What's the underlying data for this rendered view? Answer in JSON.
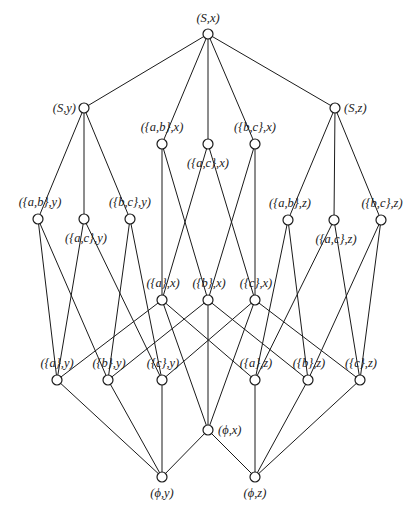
{
  "diagram": {
    "type": "hasse-lattice",
    "nodes": [
      {
        "id": "S_x",
        "label": "(S,x)",
        "x": 208,
        "y": 34,
        "lx": 208,
        "ly": 22,
        "anchor": "middle"
      },
      {
        "id": "S_y",
        "label": "(S,y)",
        "x": 84,
        "y": 108,
        "lx": 76,
        "ly": 112,
        "anchor": "end"
      },
      {
        "id": "S_z",
        "label": "(S,z)",
        "x": 335,
        "y": 108,
        "lx": 344,
        "ly": 112,
        "anchor": "start"
      },
      {
        "id": "ab_x",
        "label": "({a,b},x)",
        "x": 162,
        "y": 144,
        "lx": 162,
        "ly": 131,
        "anchor": "middle"
      },
      {
        "id": "ac_x",
        "label": "({a,c},x)",
        "x": 208,
        "y": 144,
        "lx": 208,
        "ly": 167,
        "anchor": "middle"
      },
      {
        "id": "bc_x",
        "label": "({b,c},x)",
        "x": 255,
        "y": 144,
        "lx": 255,
        "ly": 131,
        "anchor": "middle"
      },
      {
        "id": "ab_y",
        "label": "({a,b},y)",
        "x": 38,
        "y": 219,
        "lx": 40,
        "ly": 206,
        "anchor": "middle"
      },
      {
        "id": "ac_y",
        "label": "({a,c},y)",
        "x": 84,
        "y": 219,
        "lx": 86,
        "ly": 242,
        "anchor": "middle"
      },
      {
        "id": "bc_y",
        "label": "({b,c},y)",
        "x": 130,
        "y": 219,
        "lx": 130,
        "ly": 206,
        "anchor": "middle"
      },
      {
        "id": "ab_z",
        "label": "({a,b},z)",
        "x": 288,
        "y": 220,
        "lx": 290,
        "ly": 207,
        "anchor": "middle"
      },
      {
        "id": "ac_z",
        "label": "({a,c},z)",
        "x": 334,
        "y": 220,
        "lx": 336,
        "ly": 243,
        "anchor": "middle"
      },
      {
        "id": "bc_z",
        "label": "({b,c},z)",
        "x": 381,
        "y": 220,
        "lx": 382,
        "ly": 207,
        "anchor": "middle"
      },
      {
        "id": "a_x",
        "label": "({a},x)",
        "x": 162,
        "y": 300,
        "lx": 163,
        "ly": 287,
        "anchor": "middle"
      },
      {
        "id": "b_x",
        "label": "({b},x)",
        "x": 208,
        "y": 300,
        "lx": 209,
        "ly": 287,
        "anchor": "middle"
      },
      {
        "id": "c_x",
        "label": "({c},x)",
        "x": 255,
        "y": 300,
        "lx": 256,
        "ly": 287,
        "anchor": "middle"
      },
      {
        "id": "a_y",
        "label": "({a},y)",
        "x": 57,
        "y": 380,
        "lx": 57,
        "ly": 367,
        "anchor": "middle"
      },
      {
        "id": "b_y",
        "label": "({b},y)",
        "x": 108,
        "y": 380,
        "lx": 109,
        "ly": 367,
        "anchor": "middle"
      },
      {
        "id": "c_y",
        "label": "({c},y)",
        "x": 162,
        "y": 380,
        "lx": 163,
        "ly": 367,
        "anchor": "middle"
      },
      {
        "id": "a_z",
        "label": "({a},z)",
        "x": 255,
        "y": 380,
        "lx": 256,
        "ly": 367,
        "anchor": "middle"
      },
      {
        "id": "b_z",
        "label": "({b},z)",
        "x": 308,
        "y": 380,
        "lx": 309,
        "ly": 367,
        "anchor": "middle"
      },
      {
        "id": "c_z",
        "label": "({c},z)",
        "x": 360,
        "y": 380,
        "lx": 361,
        "ly": 367,
        "anchor": "middle"
      },
      {
        "id": "phi_x",
        "label": "(ϕ,x)",
        "x": 208,
        "y": 430,
        "lx": 218,
        "ly": 434,
        "anchor": "start"
      },
      {
        "id": "phi_y",
        "label": "(ϕ,y)",
        "x": 162,
        "y": 477,
        "lx": 162,
        "ly": 497,
        "anchor": "middle"
      },
      {
        "id": "phi_z",
        "label": "(ϕ,z)",
        "x": 255,
        "y": 477,
        "lx": 255,
        "ly": 497,
        "anchor": "middle"
      }
    ],
    "edges": [
      [
        "S_x",
        "S_y"
      ],
      [
        "S_x",
        "ab_x"
      ],
      [
        "S_x",
        "ac_x"
      ],
      [
        "S_x",
        "bc_x"
      ],
      [
        "S_x",
        "S_z"
      ],
      [
        "S_y",
        "ab_y"
      ],
      [
        "S_y",
        "ac_y"
      ],
      [
        "S_y",
        "bc_y"
      ],
      [
        "S_z",
        "ab_z"
      ],
      [
        "S_z",
        "ac_z"
      ],
      [
        "S_z",
        "bc_z"
      ],
      [
        "ab_x",
        "a_x"
      ],
      [
        "ab_x",
        "b_x"
      ],
      [
        "ac_x",
        "a_x"
      ],
      [
        "ac_x",
        "c_x"
      ],
      [
        "bc_x",
        "b_x"
      ],
      [
        "bc_x",
        "c_x"
      ],
      [
        "ab_y",
        "a_y"
      ],
      [
        "ab_y",
        "b_y"
      ],
      [
        "ac_y",
        "a_y"
      ],
      [
        "ac_y",
        "c_y"
      ],
      [
        "bc_y",
        "b_y"
      ],
      [
        "bc_y",
        "c_y"
      ],
      [
        "ab_z",
        "a_z"
      ],
      [
        "ab_z",
        "b_z"
      ],
      [
        "ac_z",
        "a_z"
      ],
      [
        "ac_z",
        "c_z"
      ],
      [
        "bc_z",
        "b_z"
      ],
      [
        "bc_z",
        "c_z"
      ],
      [
        "a_x",
        "a_y"
      ],
      [
        "a_x",
        "a_z"
      ],
      [
        "a_x",
        "phi_x"
      ],
      [
        "b_x",
        "b_y"
      ],
      [
        "b_x",
        "b_z"
      ],
      [
        "b_x",
        "phi_x"
      ],
      [
        "c_x",
        "c_y"
      ],
      [
        "c_x",
        "c_z"
      ],
      [
        "c_x",
        "phi_x"
      ],
      [
        "a_y",
        "phi_y"
      ],
      [
        "b_y",
        "phi_y"
      ],
      [
        "c_y",
        "phi_y"
      ],
      [
        "phi_x",
        "phi_y"
      ],
      [
        "a_z",
        "phi_z"
      ],
      [
        "b_z",
        "phi_z"
      ],
      [
        "c_z",
        "phi_z"
      ],
      [
        "phi_x",
        "phi_z"
      ]
    ],
    "node_radius": 5,
    "colors": {
      "line": "#1a1a1a",
      "node_fill": "#ffffff",
      "background": "#ffffff"
    }
  }
}
